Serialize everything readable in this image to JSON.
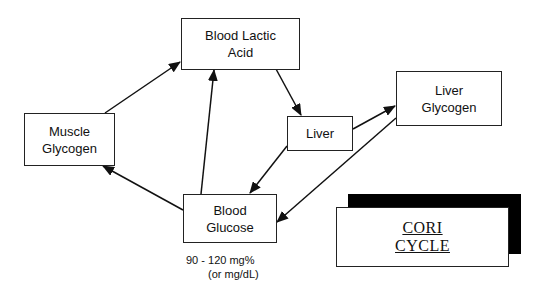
{
  "diagram": {
    "title": "CORI CYCLE",
    "title_lines": [
      "CORI",
      "CYCLE"
    ],
    "nodes": {
      "blood_lactic_acid": {
        "lines": [
          "Blood Lactic",
          "Acid"
        ]
      },
      "muscle_glycogen": {
        "lines": [
          "Muscle",
          "Glycogen"
        ]
      },
      "liver": {
        "lines": [
          "Liver"
        ]
      },
      "liver_glycogen": {
        "lines": [
          "Liver",
          "Glycogen"
        ]
      },
      "blood_glucose": {
        "lines": [
          "Blood",
          "Glucose"
        ]
      }
    },
    "blood_glucose_note": [
      "90 - 120 mg%",
      "(or mg/dL)"
    ],
    "edges": [
      {
        "from": "Muscle Glycogen",
        "to": "Blood Lactic Acid"
      },
      {
        "from": "Blood Lactic Acid",
        "to": "Liver"
      },
      {
        "from": "Liver",
        "to": "Liver Glycogen"
      },
      {
        "from": "Liver",
        "to": "Blood Glucose"
      },
      {
        "from": "Liver Glycogen",
        "to": "Blood Glucose"
      },
      {
        "from": "Blood Glucose",
        "to": "Blood Lactic Acid"
      },
      {
        "from": "Blood Glucose",
        "to": "Muscle Glycogen"
      }
    ],
    "colors": {
      "line": "#111111",
      "background": "#ffffff",
      "shadow": "#000000"
    }
  }
}
